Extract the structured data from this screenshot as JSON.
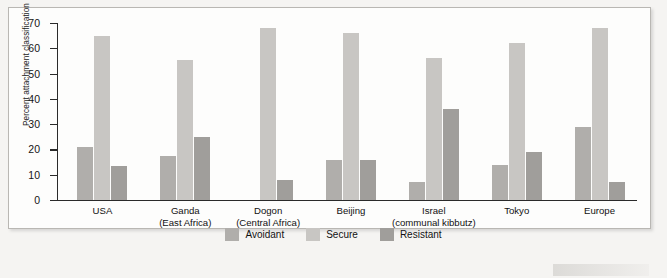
{
  "chart_data": {
    "type": "bar",
    "title": "",
    "xlabel": "",
    "ylabel": "Percent attachment classification",
    "ylim": [
      0,
      70
    ],
    "yticks": [
      0,
      10,
      20,
      30,
      40,
      50,
      60,
      70
    ],
    "grid": false,
    "legend_position": "bottom-center",
    "categories": [
      "USA",
      "Ganda (East Africa)",
      "Dogon (Central Africa)",
      "Beijing",
      "Israel (communal kibbutz)",
      "Tokyo",
      "Europe"
    ],
    "category_labels": [
      {
        "line1": "USA",
        "line2": ""
      },
      {
        "line1": "Ganda",
        "line2": "(East Africa)"
      },
      {
        "line1": "Dogon",
        "line2": "(Central Africa)"
      },
      {
        "line1": "Beijing",
        "line2": ""
      },
      {
        "line1": "Israel",
        "line2": "(communal kibbutz)"
      },
      {
        "line1": "Tokyo",
        "line2": ""
      },
      {
        "line1": "Europe",
        "line2": ""
      }
    ],
    "series": [
      {
        "name": "Avoidant",
        "color": "#b0aeab",
        "values": [
          21,
          17.5,
          0,
          16,
          7,
          14,
          29
        ]
      },
      {
        "name": "Secure",
        "color": "#c8c6c3",
        "values": [
          65,
          55.5,
          68,
          66,
          56,
          62,
          68
        ]
      },
      {
        "name": "Resistant",
        "color": "#a09e9b",
        "values": [
          13.5,
          25,
          8,
          16,
          36,
          19,
          7
        ]
      }
    ]
  },
  "legend": {
    "items": [
      {
        "label": "Avoidant",
        "color": "#b0aeab"
      },
      {
        "label": "Secure",
        "color": "#c8c6c3"
      },
      {
        "label": "Resistant",
        "color": "#a09e9b"
      }
    ]
  },
  "axis": {
    "y_title": "Percent attachment classification",
    "y_tick_labels": [
      "0",
      "10",
      "20",
      "30",
      "40",
      "50",
      "60",
      "70"
    ]
  }
}
